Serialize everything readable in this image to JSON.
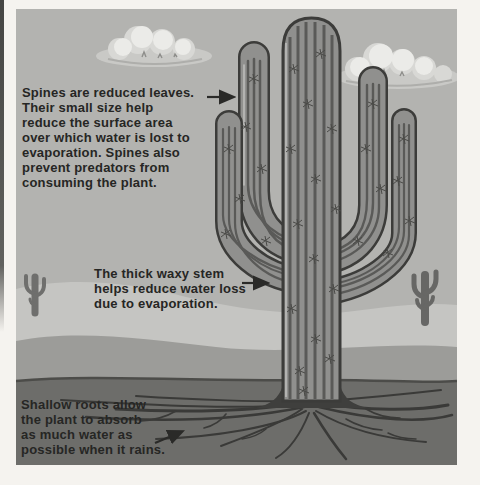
{
  "page": {
    "kind": "textbook-diagram",
    "background_color": "#f5f3ef"
  },
  "illustration": {
    "title": "Saguaro cactus adaptation diagram",
    "colors": {
      "sky": "#b3b3b0",
      "cloud_base": "#c9c9c6",
      "cloud_highlight": "#ebebe8",
      "hill_light": "#c5c5c2",
      "hill_mid": "#9c9c99",
      "soil": "#6d6d6a",
      "root": "#3a3a38",
      "cactus_body": "#90908e",
      "cactus_rib": "#5a5a58",
      "cactus_outline": "#3c3c3a",
      "small_cactus": "#6f6f6d",
      "annotation_text": "#262624",
      "arrow": "#2a2a28"
    },
    "annotations": {
      "spines": {
        "text": "Spines are reduced leaves.\nTheir small size help\nreduce the surface area\nover which water is lost to\nevaporation. Spines also\nprevent predators from\nconsuming the plant."
      },
      "stem": {
        "text": "The thick waxy stem\nhelps reduce water loss\ndue to evaporation."
      },
      "roots": {
        "text": "Shallow roots allow\nthe plant to absorb\nas much water as\npossible when it rains."
      }
    },
    "scene": {
      "elements": [
        "sky",
        "cloud-left",
        "cloud-right",
        "distant-light-hills",
        "mid-gray-hills",
        "soil-band",
        "shallow-root-network",
        "saguaro-cactus-with-spines",
        "small-cactus-silhouette-left",
        "small-cactus-silhouette-right"
      ],
      "arrows": [
        {
          "id": "spines-arrow",
          "points_at": "upper cactus arm"
        },
        {
          "id": "stem-arrow",
          "points_at": "main cactus stem"
        },
        {
          "id": "roots-arrow",
          "points_at": "shallow roots"
        }
      ]
    }
  }
}
